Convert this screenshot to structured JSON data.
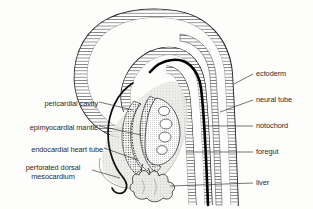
{
  "figure": {
    "background_color": "#fdfdfb",
    "ink_color": "#1c1c1c"
  },
  "labels_left": [
    {
      "id": "pericardial-cavity",
      "text": "pericardial cavity",
      "x": 18,
      "y": 104,
      "align": "right"
    },
    {
      "id": "epimyocardial-mantle",
      "text": "epimyocardial mantle",
      "x": 8,
      "y": 129,
      "align": "right"
    },
    {
      "id": "endocardial-heart-tube",
      "text": "endocardial heart tube",
      "x": 4,
      "y": 151,
      "align": "right"
    },
    {
      "id": "perforated-dorsal-mesocardium-line1",
      "text": "perforated dorsal",
      "x": 30,
      "y": 169,
      "align": "center"
    },
    {
      "id": "perforated-dorsal-mesocardium-line2",
      "text": "mesocardium",
      "x": 44,
      "y": 178,
      "align": "center"
    }
  ],
  "labels_right": [
    {
      "id": "ectoderm",
      "text": "ectoderm",
      "x": 256,
      "y": 76,
      "align": "left"
    },
    {
      "id": "neural-tube",
      "text": "neural tube",
      "x": 256,
      "y": 102,
      "align": "left"
    },
    {
      "id": "notochord",
      "text": "notochord",
      "x": 256,
      "y": 128,
      "align": "left"
    },
    {
      "id": "foregut",
      "text": "foregut",
      "x": 256,
      "y": 154,
      "align": "left"
    },
    {
      "id": "liver",
      "text": "liver",
      "x": 256,
      "y": 185,
      "align": "left"
    }
  ],
  "structures": {
    "ectoderm": "outer stippled double-layer body wall",
    "neural_tube": "stippled tube running down right side",
    "notochord": "thick solid black curved rod",
    "foregut": "narrow tube right of heart",
    "liver": "lobed mass at lower centre",
    "pericardial_cavity": "open space surrounding heart tube",
    "epimyocardial_mantle": "stippled layer around endocardial tube",
    "endocardial_heart_tube": "inner dotted tube",
    "perforated_dorsal_mesocardium": "fenestrated dorsal attachment"
  }
}
